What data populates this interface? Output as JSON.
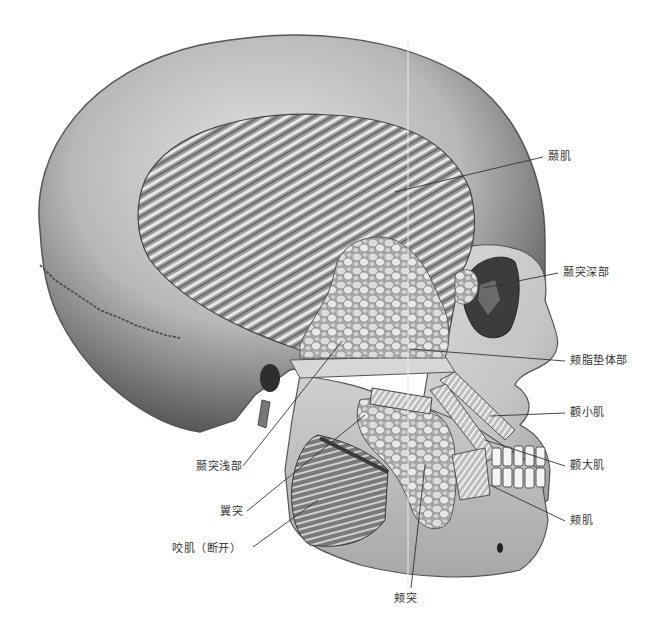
{
  "figure": {
    "colors": {
      "background": "#ffffff",
      "bone_light": "#e6e6e6",
      "bone_mid": "#bdbdbd",
      "bone_dark": "#5a5a5a",
      "muscle": "#8a8a8a",
      "fat": "#d2d2d2",
      "leader_line": "#333333",
      "label_text": "#333333"
    }
  },
  "labels": [
    {
      "id": "temporalis",
      "text": "颞肌",
      "x": 548,
      "y": 150,
      "lx1": 395,
      "ly1": 192,
      "lx2": 543,
      "ly2": 157
    },
    {
      "id": "temporal-extension-deep",
      "text": "颞突深部",
      "x": 563,
      "y": 266,
      "lx1": 483,
      "ly1": 288,
      "lx2": 558,
      "ly2": 273
    },
    {
      "id": "buccal-fat-body",
      "text": "颊脂垫体部",
      "x": 570,
      "y": 354,
      "lx1": 410,
      "ly1": 349,
      "lx2": 565,
      "ly2": 361
    },
    {
      "id": "zygomaticus-minor",
      "text": "颧小肌",
      "x": 570,
      "y": 406,
      "lx1": 490,
      "ly1": 416,
      "lx2": 565,
      "ly2": 413
    },
    {
      "id": "zygomaticus-major",
      "text": "颧大肌",
      "x": 570,
      "y": 459,
      "lx1": 485,
      "ly1": 440,
      "lx2": 565,
      "ly2": 466
    },
    {
      "id": "buccinator",
      "text": "颊肌",
      "x": 570,
      "y": 514,
      "lx1": 490,
      "ly1": 485,
      "lx2": 565,
      "ly2": 521
    },
    {
      "id": "temporal-extension-superficial",
      "text": "颞突浅部",
      "x": 196,
      "y": 460,
      "lx1": 342,
      "ly1": 341,
      "lx2": 243,
      "ly2": 466
    },
    {
      "id": "pterygoid-extension",
      "text": "翼突",
      "x": 220,
      "y": 505,
      "lx1": 365,
      "ly1": 415,
      "lx2": 247,
      "ly2": 511
    },
    {
      "id": "masseter-cut",
      "text": "咬肌（断开）",
      "x": 172,
      "y": 542,
      "lx1": 318,
      "ly1": 500,
      "lx2": 253,
      "ly2": 547
    },
    {
      "id": "buccal-extension",
      "text": "颊突",
      "x": 394,
      "y": 592,
      "lx1": 425,
      "ly1": 465,
      "lx2": 411,
      "ly2": 588
    }
  ]
}
